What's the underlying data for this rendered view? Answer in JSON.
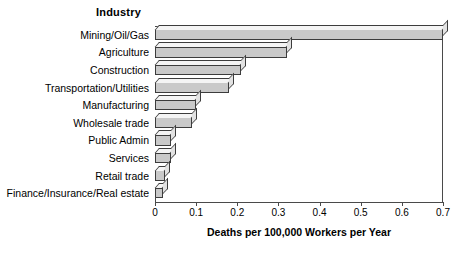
{
  "chart_data": {
    "type": "bar",
    "orientation": "horizontal",
    "title": "",
    "ylabel": "Industry",
    "xlabel": "Deaths per 100,000 Workers per Year",
    "xlim": [
      0,
      0.7
    ],
    "xticks": [
      "0",
      "0.1",
      "0.2",
      "0.3",
      "0.4",
      "0.5",
      "0.6",
      "0.7"
    ],
    "xtick_values": [
      0,
      0.1,
      0.2,
      0.3,
      0.4,
      0.5,
      0.6,
      0.7
    ],
    "grid": false,
    "legend": false,
    "bar_style": "3d-extruded",
    "bar_fill_color": "#c9c9c9",
    "bar_top_color": "#f4f4f4",
    "bar_side_color": "#e2e2e2",
    "bar_edge_color": "#3c3c3c",
    "categories": [
      "Mining/Oil/Gas",
      "Agriculture",
      "Construction",
      "Transportation/Utilities",
      "Manufacturing",
      "Wholesale trade",
      "Public Admin",
      "Services",
      "Retail trade",
      "Finance/Insurance/Real estate"
    ],
    "values": [
      0.7,
      0.32,
      0.21,
      0.18,
      0.1,
      0.09,
      0.04,
      0.04,
      0.025,
      0.02
    ]
  },
  "caption": {
    "text": ""
  }
}
